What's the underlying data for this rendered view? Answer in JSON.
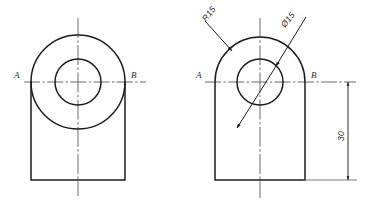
{
  "drawing": {
    "title": "Two orthographic views of a bracket with a bore",
    "line_color": "#1c1c1c",
    "center_line_color": "#6a6a6a",
    "dimension_color": "#4a4a4a",
    "background": "#ffffff"
  },
  "views": [
    {
      "id": "left-view",
      "name": "left-view-circular",
      "center": {
        "x": 78,
        "y": 82
      },
      "outer_circle_radius": 47,
      "inner_circle_radius": 23,
      "body": {
        "left": 31,
        "right": 125,
        "top": 82,
        "bottom": 180
      },
      "section_labels": {
        "left": "A",
        "right": "B"
      },
      "section_label_positions": {
        "left_x": 14,
        "right_x": 131,
        "y": 77
      }
    },
    {
      "id": "right-view",
      "name": "right-view-d-shape",
      "center": {
        "x": 260,
        "y": 82
      },
      "arc_radius": 45,
      "inner_circle_radius": 23,
      "body": {
        "left": 215,
        "right": 305,
        "top": 82,
        "bottom": 180
      },
      "section_labels": {
        "left": "A",
        "right": "B"
      },
      "section_label_positions": {
        "left_x": 196,
        "right_x": 311,
        "y": 77
      }
    }
  ],
  "annotations": [
    {
      "id": "radius-callout",
      "name": "radius-callout-r15",
      "text": "R15",
      "text_x": 207,
      "text_y": 22,
      "rotation": -52,
      "leader": {
        "x1": 205,
        "y1": 22,
        "x2": 233,
        "y2": 52
      }
    },
    {
      "id": "diameter-callout",
      "name": "diameter-callout-d15",
      "text": "Ø15",
      "text_x": 282,
      "text_y": 27,
      "rotation": -52,
      "leader": {
        "x1": 305,
        "y1": 18,
        "x2": 277,
        "y2": 65
      }
    }
  ],
  "dimensions": [
    {
      "id": "height-dimension",
      "name": "dimension-30",
      "value": "30",
      "orientation": "vertical",
      "line_x": 348,
      "y_top": 82,
      "y_bottom": 180,
      "text_x": 345,
      "text_y": 136,
      "rotation": 90,
      "extension_from_x": 305
    }
  ]
}
